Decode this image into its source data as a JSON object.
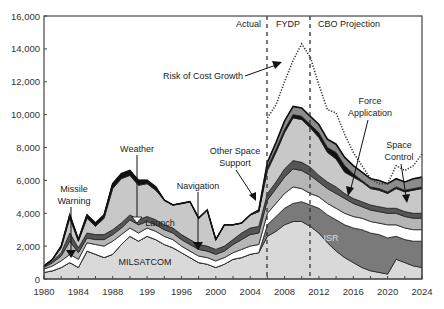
{
  "chart_data": {
    "type": "area",
    "title": "",
    "xlabel": "",
    "ylabel": "",
    "xlim": [
      1980,
      2024
    ],
    "ylim": [
      0,
      16000
    ],
    "x_ticks": [
      "1980",
      "1984",
      "1988",
      "199",
      "1996",
      "2000",
      "2004",
      "2008",
      "2012",
      "2016",
      "2020",
      "2024"
    ],
    "y_ticks": [
      "0",
      "2,000",
      "4,000",
      "6,000",
      "8,000",
      "10,000",
      "12,000",
      "14,000",
      "16,000"
    ],
    "grid": false,
    "stacked": true,
    "x": [
      1980,
      1981,
      1982,
      1983,
      1984,
      1985,
      1986,
      1987,
      1988,
      1989,
      1990,
      1991,
      1992,
      1993,
      1994,
      1995,
      1996,
      1997,
      1998,
      1999,
      2000,
      2001,
      2002,
      2003,
      2004,
      2005,
      2006,
      2007,
      2008,
      2009,
      2010,
      2011,
      2012,
      2013,
      2014,
      2015,
      2016,
      2017,
      2018,
      2019,
      2020,
      2021,
      2022,
      2023,
      2024
    ],
    "series": [
      {
        "name": "MILSATCOM",
        "color": "#d9d9d9",
        "values": [
          400,
          500,
          700,
          1000,
          700,
          1700,
          1500,
          1300,
          1500,
          2100,
          2600,
          2300,
          2600,
          2400,
          2100,
          1900,
          1600,
          1300,
          1000,
          900,
          700,
          900,
          1200,
          1300,
          1500,
          1600,
          2600,
          2900,
          3300,
          3500,
          3500,
          3200,
          2800,
          2200,
          1700,
          1300,
          1000,
          700,
          500,
          400,
          300,
          1200,
          1000,
          800,
          700
        ]
      },
      {
        "name": "ISR",
        "color": "#7a7a7a",
        "values": [
          0,
          0,
          0,
          0,
          0,
          0,
          0,
          0,
          0,
          0,
          0,
          0,
          0,
          0,
          0,
          0,
          0,
          0,
          0,
          0,
          0,
          0,
          0,
          0,
          0,
          0,
          700,
          900,
          1000,
          1100,
          1200,
          1300,
          1500,
          1700,
          1900,
          2000,
          2100,
          2300,
          2300,
          2300,
          2200,
          1400,
          1400,
          1500,
          1600
        ]
      },
      {
        "name": "Navigation/white",
        "color": "#ffffff",
        "values": [
          200,
          300,
          400,
          500,
          500,
          500,
          600,
          700,
          800,
          600,
          500,
          500,
          500,
          500,
          500,
          500,
          400,
          400,
          400,
          400,
          400,
          400,
          400,
          500,
          500,
          500,
          700,
          800,
          900,
          1000,
          800,
          700,
          700,
          700,
          700,
          700,
          700,
          700,
          700,
          700,
          800,
          700,
          700,
          700,
          700
        ]
      },
      {
        "name": "Launch",
        "color": "#b5b5b5",
        "values": [
          100,
          200,
          300,
          800,
          400,
          300,
          300,
          400,
          400,
          400,
          500,
          500,
          400,
          400,
          400,
          400,
          400,
          400,
          400,
          400,
          400,
          400,
          500,
          600,
          700,
          700,
          800,
          900,
          1000,
          1100,
          1100,
          1100,
          900,
          900,
          900,
          900,
          800,
          700,
          700,
          700,
          700,
          700,
          700,
          700,
          700
        ]
      },
      {
        "name": "Weather",
        "color": "#555555",
        "values": [
          100,
          100,
          200,
          500,
          300,
          300,
          300,
          300,
          300,
          300,
          300,
          300,
          300,
          300,
          300,
          300,
          300,
          300,
          300,
          300,
          300,
          300,
          300,
          400,
          400,
          400,
          400,
          400,
          500,
          500,
          500,
          500,
          400,
          400,
          400,
          300,
          300,
          300,
          300,
          300,
          300,
          300,
          300,
          300,
          300
        ]
      },
      {
        "name": "Other Space Support",
        "color": "#c8c8c8",
        "values": [
          0,
          100,
          300,
          900,
          400,
          900,
          500,
          1000,
          2500,
          2700,
          2400,
          2100,
          2000,
          1800,
          1500,
          1400,
          1900,
          2300,
          1600,
          2200,
          600,
          1300,
          900,
          600,
          800,
          900,
          1400,
          1800,
          2200,
          2600,
          2600,
          2400,
          2300,
          1800,
          1700,
          1300,
          1300,
          1200,
          1000,
          1000,
          900,
          1200,
          1200,
          1400,
          1500
        ]
      },
      {
        "name": "Force Application",
        "color": "#111111",
        "values": [
          0,
          0,
          100,
          200,
          100,
          200,
          200,
          200,
          300,
          300,
          300,
          300,
          200,
          200,
          0,
          0,
          0,
          0,
          0,
          0,
          0,
          0,
          0,
          0,
          0,
          0,
          200,
          200,
          200,
          200,
          200,
          200,
          300,
          300,
          400,
          400,
          200,
          100,
          100,
          100,
          100,
          100,
          100,
          100,
          100
        ]
      },
      {
        "name": "Space Control",
        "color": "#8c8c8c",
        "values": [
          0,
          0,
          0,
          0,
          0,
          0,
          0,
          0,
          0,
          0,
          0,
          0,
          0,
          0,
          0,
          0,
          0,
          0,
          0,
          0,
          0,
          0,
          0,
          0,
          0,
          100,
          300,
          400,
          500,
          500,
          500,
          500,
          500,
          500,
          500,
          500,
          500,
          500,
          500,
          500,
          500,
          500,
          500,
          600,
          600
        ]
      }
    ],
    "risk_of_cost_growth": {
      "name": "Risk of Cost Growth",
      "style": "dotted",
      "x": [
        2006,
        2007,
        2008,
        2009,
        2010,
        2011,
        2012,
        2013,
        2014,
        2015,
        2016,
        2017,
        2018,
        2019,
        2020,
        2021,
        2022,
        2023,
        2024
      ],
      "values": [
        9800,
        10600,
        12000,
        13300,
        14300,
        13500,
        11800,
        10300,
        10100,
        8800,
        7700,
        6900,
        6100,
        5800,
        5800,
        6900,
        6600,
        6900,
        7600
      ]
    },
    "period_dividers": [
      2006,
      2011
    ],
    "period_labels": [
      "Actual",
      "FYDP",
      "CBO Projection"
    ],
    "annotations": [
      "Missile Warning",
      "Weather",
      "Launch",
      "Navigation",
      "Other Space Support",
      "Risk of Cost Growth",
      "Force Application",
      "Space Control",
      "MILSATCOM",
      "ISR"
    ]
  },
  "labels": {
    "actual": "Actual",
    "fydp": "FYDP",
    "cbo": "CBO Projection",
    "risk": "Risk of Cost Growth",
    "missile1": "Missile",
    "missile2": "Warning",
    "weather": "Weather",
    "launch": "Launch",
    "navigation": "Navigation",
    "other1": "Other Space",
    "other2": "Support",
    "force1": "Force",
    "force2": "Application",
    "control1": "Space",
    "control2": "Control",
    "milsatcom": "MILSATCOM",
    "isr": "ISR"
  }
}
